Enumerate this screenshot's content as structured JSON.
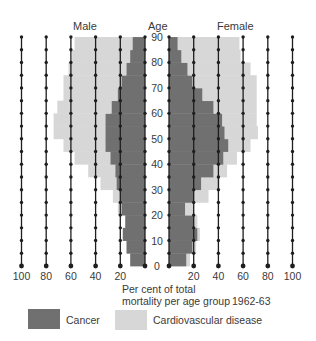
{
  "header": {
    "male_label": "Male",
    "age_label": "Age",
    "female_label": "Female"
  },
  "axis": {
    "caption_line1": "Per cent of total",
    "caption_line2": "mortality per age group",
    "period": "1962-63",
    "male_ticks": [
      "100",
      "80",
      "60",
      "40",
      "20"
    ],
    "female_ticks": [
      "20",
      "40",
      "60",
      "80",
      "100"
    ],
    "age_ticks": [
      "0",
      "10",
      "20",
      "30",
      "40",
      "50",
      "60",
      "70",
      "80",
      "90"
    ]
  },
  "legend": {
    "cancer_label": "Cancer",
    "cardio_label": "Cardiovascular disease"
  },
  "colors": {
    "cancer": "#707070",
    "cardio": "#d7d7d7",
    "gridline": "#1e1e1e",
    "text": "#3a3a3a"
  },
  "chart_data": {
    "type": "bar",
    "subtype": "population-pyramid (stacked, horizontal)",
    "title": "",
    "xlabel": "Per cent of total mortality per age group",
    "ylabel": "Age",
    "period": "1962-63",
    "xlim": [
      0,
      100
    ],
    "ylim": [
      0,
      90
    ],
    "x_ticks": [
      0,
      20,
      40,
      60,
      80,
      100
    ],
    "y_ticks": [
      0,
      10,
      20,
      30,
      40,
      50,
      60,
      70,
      80,
      90
    ],
    "grid": "vertical lines every 20% with dots every 5 years",
    "legend_position": "bottom",
    "age_group_starts": [
      0,
      5,
      10,
      15,
      20,
      25,
      30,
      35,
      40,
      45,
      50,
      55,
      60,
      65,
      70,
      75,
      80,
      85
    ],
    "age_group_width": 5,
    "series": [
      {
        "name": "Male - Cancer",
        "side": "male",
        "stack_order": 0,
        "values": [
          12,
          15,
          18,
          16,
          19,
          20,
          23,
          24,
          28,
          32,
          32,
          32,
          27,
          22,
          19,
          15,
          12,
          10
        ]
      },
      {
        "name": "Male - Cardiovascular disease",
        "side": "male",
        "stack_order": 1,
        "values": [
          0,
          0,
          0,
          0,
          3,
          6,
          13,
          22,
          29,
          34,
          42,
          42,
          44,
          44,
          47,
          47,
          47,
          47
        ]
      },
      {
        "name": "Female - Cancer",
        "side": "female",
        "stack_order": 0,
        "values": [
          14,
          19,
          23,
          20,
          13,
          20,
          26,
          36,
          44,
          48,
          45,
          43,
          36,
          27,
          19,
          15,
          10,
          7
        ]
      },
      {
        "name": "Female - Cardiovascular disease",
        "side": "female",
        "stack_order": 1,
        "values": [
          3,
          3,
          2,
          3,
          7,
          12,
          15,
          11,
          11,
          18,
          27,
          28,
          35,
          44,
          52,
          51,
          48,
          50
        ]
      }
    ]
  }
}
